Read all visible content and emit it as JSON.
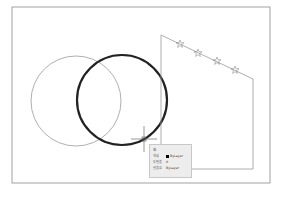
{
  "drawing": {
    "frame": {
      "x": 12,
      "y": 7,
      "w": 258,
      "h": 176,
      "color": "#8a8a8a"
    },
    "circles": [
      {
        "name": "thin-circle",
        "cx": 76,
        "cy": 101,
        "r": 45,
        "stroke": "#9a9a9a",
        "width": 0.8
      },
      {
        "name": "selected-thick-circle",
        "cx": 122,
        "cy": 100,
        "r": 45,
        "stroke": "#222222",
        "width": 2.2
      }
    ],
    "polyline": {
      "points": "161,144 161,35 253,79 253,169 192,169",
      "stroke": "#9a9a9a"
    },
    "stars": [
      {
        "x": 180,
        "y": 44
      },
      {
        "x": 198,
        "y": 53
      },
      {
        "x": 217,
        "y": 61
      },
      {
        "x": 235,
        "y": 70
      }
    ],
    "crosshair": {
      "x": 144,
      "y": 139
    }
  },
  "tooltip": {
    "title": "원",
    "rows": [
      {
        "label": "색상",
        "value": "ByLayer",
        "swatch": "#000000"
      },
      {
        "label": "도면층",
        "value": "0"
      },
      {
        "label": "선종류",
        "value": "ByLayer"
      }
    ]
  }
}
